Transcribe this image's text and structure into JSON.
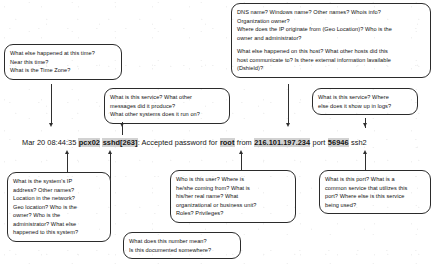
{
  "log_line": {
    "name": "syslog-entry",
    "segments": [
      {
        "text": "Mar 20 08:44:35 ",
        "highlight": false
      },
      {
        "text": "pcx02",
        "highlight": true
      },
      {
        "text": " ",
        "highlight": false
      },
      {
        "text": "sshd[263]",
        "highlight": true
      },
      {
        "text": ": Accepted password for ",
        "highlight": false
      },
      {
        "text": "root",
        "highlight": true
      },
      {
        "text": " from ",
        "highlight": false
      },
      {
        "text": "216.101.197.234",
        "highlight": true
      },
      {
        "text": " port ",
        "highlight": false
      },
      {
        "text": "56946",
        "highlight": true
      },
      {
        "text": " ssh2",
        "highlight": false
      }
    ],
    "full_text": "Mar 20 08:44:35 pcx02 sshd[263]: Accepted password for root from 216.101.197.234 port 56946 ssh2",
    "fields": {
      "timestamp": "Mar 20 08:44:35",
      "host": "pcx02",
      "process": "sshd[263]",
      "message": "Accepted password for root",
      "source_ip": "216.101.197.234",
      "source_port": "56946",
      "protocol": "ssh2"
    }
  },
  "callouts": [
    {
      "id": "timestamp-questions",
      "target": "timestamp",
      "lines": [
        "What else happened at this time?",
        "Near this time?",
        "What is the Time Zone?"
      ]
    },
    {
      "id": "host-questions",
      "target": "host",
      "lines": [
        "DNS name? Windows name? Other names? Whois info?",
        "Organization owner?",
        "Where does the IP originate from (Geo Location)? Who is the",
        "owner and administrator?"
      ],
      "lines2": [
        "What else happened on this host?  What other hosts did this",
        "host communicate to? Is there external information lavailable",
        "(Dshield)?"
      ]
    },
    {
      "id": "process-questions",
      "target": "process",
      "lines": [
        "What is this service?  What other",
        "messages did it produce?",
        "What other systems does it run on?"
      ]
    },
    {
      "id": "protocol-questions",
      "target": "protocol",
      "lines": [
        "What is this service?  Where",
        "else does it show up in logs?"
      ]
    },
    {
      "id": "system-identity-questions",
      "target": "host",
      "lines": [
        "What is the system's IP",
        "address? Other names?",
        "Location in the network?",
        "Geo location? Who is the",
        "owner? Who is the",
        "administrator?  What else",
        "happened to this system?"
      ]
    },
    {
      "id": "pid-questions",
      "target": "process",
      "lines": [
        "What does this number mean?",
        "Is this documented somewhere?"
      ]
    },
    {
      "id": "user-questions",
      "target": "message",
      "lines": [
        "Who is this user?  Where is",
        "he/she coming from?  What is",
        "his/her real name? What",
        "organizational or business unit?",
        "Roles? Privileges?"
      ]
    },
    {
      "id": "port-questions",
      "target": "source_port",
      "lines": [
        "What is this port?  What is a",
        "common service that utilizes this",
        "port? Where else is this service",
        "being used?"
      ]
    }
  ]
}
